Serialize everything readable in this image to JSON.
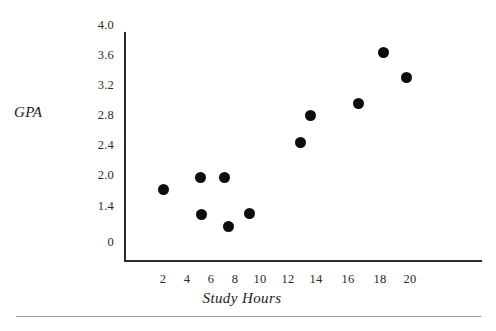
{
  "chart_data": {
    "type": "scatter",
    "title": "",
    "xlabel": "Study Hours",
    "ylabel": "GPA",
    "xlim": [
      0,
      22
    ],
    "ylim": [
      0,
      4.0
    ],
    "grid": false,
    "legend": null,
    "marker": {
      "shape": "circle",
      "color": "#0d0d0d",
      "size_px": 11
    },
    "xticks": [
      "2",
      "4",
      "6",
      "8",
      "10",
      "12",
      "14",
      "16",
      "18",
      "20"
    ],
    "xtick_values": [
      2,
      4,
      6,
      8,
      10,
      12,
      14,
      16,
      18,
      20
    ],
    "yticks": [
      "0",
      "1.4",
      "2.0",
      "2.4",
      "2.8",
      "3.2",
      "3.6",
      "4.0"
    ],
    "ytick_values": [
      0,
      1.4,
      2.0,
      2.4,
      2.8,
      3.2,
      3.6,
      4.0
    ],
    "points": [
      {
        "x": 2.3,
        "y": 1.9,
        "label": "p1"
      },
      {
        "x": 5.4,
        "y": 2.1,
        "label": "p2"
      },
      {
        "x": 7.4,
        "y": 2.1,
        "label": "p3"
      },
      {
        "x": 5.5,
        "y": 1.4,
        "label": "p4"
      },
      {
        "x": 7.7,
        "y": 1.2,
        "label": "p5"
      },
      {
        "x": 9.3,
        "y": 1.4,
        "label": "p6"
      },
      {
        "x": 12.6,
        "y": 2.55,
        "label": "p7"
      },
      {
        "x": 13.4,
        "y": 2.87,
        "label": "p8"
      },
      {
        "x": 16.6,
        "y": 3.04,
        "label": "p9"
      },
      {
        "x": 18.1,
        "y": 3.64,
        "label": "p10"
      },
      {
        "x": 19.6,
        "y": 3.37,
        "label": "p11"
      }
    ],
    "series": [
      {
        "name": "GPA vs Study Hours",
        "x": [
          2.3,
          5.4,
          7.4,
          5.5,
          7.7,
          9.3,
          12.6,
          13.4,
          16.6,
          18.1,
          19.6
        ],
        "y": [
          1.9,
          2.1,
          2.1,
          1.4,
          1.2,
          1.4,
          2.55,
          2.87,
          3.04,
          3.64,
          3.37
        ]
      }
    ]
  },
  "axes": {
    "y_title": "GPA",
    "x_title": "Study Hours",
    "axis_color": "#2b2b2b"
  },
  "ytick_labels": [
    {
      "text": "4.0",
      "top": 18
    },
    {
      "text": "3.6",
      "top": 48
    },
    {
      "text": "3.2",
      "top": 78
    },
    {
      "text": "2.8",
      "top": 108
    },
    {
      "text": "2.4",
      "top": 138
    },
    {
      "text": "2.0",
      "top": 168
    },
    {
      "text": "1.4",
      "top": 199
    },
    {
      "text": "0",
      "top": 235
    }
  ],
  "xtick_labels": [
    {
      "text": "2",
      "left": 163
    },
    {
      "text": "4",
      "left": 187
    },
    {
      "text": "6",
      "left": 211
    },
    {
      "text": "8",
      "left": 235
    },
    {
      "text": "10",
      "left": 260
    },
    {
      "text": "12",
      "left": 288
    },
    {
      "text": "14",
      "left": 316
    },
    {
      "text": "16",
      "left": 348
    },
    {
      "text": "18",
      "left": 380
    },
    {
      "text": "20",
      "left": 410
    }
  ],
  "plot_points": [
    {
      "left": 163,
      "top": 189
    },
    {
      "left": 200,
      "top": 177
    },
    {
      "left": 224,
      "top": 177
    },
    {
      "left": 201,
      "top": 214
    },
    {
      "left": 228,
      "top": 226
    },
    {
      "left": 249,
      "top": 213
    },
    {
      "left": 300,
      "top": 142
    },
    {
      "left": 310,
      "top": 115
    },
    {
      "left": 358,
      "top": 103
    },
    {
      "left": 383,
      "top": 52
    },
    {
      "left": 406,
      "top": 77
    }
  ]
}
